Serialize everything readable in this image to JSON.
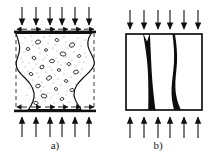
{
  "figure": {
    "background_color": "#ffffff",
    "ink_color": "#111111",
    "width": 211,
    "height": 155
  },
  "panels": [
    {
      "id": "a",
      "caption": "a)",
      "caption_x": 55,
      "caption_y": 146,
      "description": "Concrete cube under compression with platen friction, deforming into an hourglass shape",
      "specimen": {
        "left": 16,
        "right": 94,
        "top": 33,
        "bottom": 109,
        "waist_inset": 14,
        "fill_color": "#ffffff",
        "outline_color": "#111111"
      },
      "original_outline": {
        "style": "dashed",
        "color": "#3a3a3a",
        "left_x": 16,
        "right_x": 94
      },
      "platens": [
        {
          "name": "top-platen",
          "x": 14,
          "y": 31,
          "width": 82,
          "height": 2.6
        },
        {
          "name": "bottom-platen",
          "x": 14,
          "y": 110,
          "width": 82,
          "height": 2.6
        }
      ],
      "load_arrows_top": {
        "count": 6,
        "direction": "down",
        "y_start": 7,
        "y_end": 29,
        "x_positions": [
          22,
          36,
          50,
          62,
          75,
          89
        ]
      },
      "load_arrows_bottom": {
        "count": 6,
        "direction": "up",
        "y_start": 137,
        "y_end": 115,
        "x_positions": [
          22,
          36,
          50,
          62,
          75,
          89
        ]
      },
      "friction_arrows": {
        "description": "Horizontal platen friction restraint arrows",
        "top_y": 28.5,
        "bottom_y": 107,
        "segments": 6
      },
      "aggregate": {
        "particle_count": 22,
        "stipple_count": 150,
        "particle_color": "#1a1a1a",
        "stipple_color": "#2a2a2a"
      }
    },
    {
      "id": "b",
      "caption": "b)",
      "caption_x": 158,
      "caption_y": 146,
      "description": "Concrete cube under compression splitting with two vertical wedge cracks",
      "specimen": {
        "left": 126,
        "right": 202,
        "top": 34,
        "bottom": 110,
        "fill_color": "#ffffff",
        "outline_color": "#111111",
        "outline_width": 1.6
      },
      "cracks": [
        {
          "name": "left-splitting-crack",
          "top_x": 146,
          "bottom_x": 152,
          "top_width": 3.2,
          "bottom_width": 10,
          "notch": true
        },
        {
          "name": "right-splitting-crack",
          "top_x": 174,
          "bottom_x": 180,
          "top_width": 2.4,
          "bottom_width": 9,
          "notch": false
        }
      ],
      "load_arrows_top": {
        "count": 6,
        "direction": "down",
        "y_start": 10,
        "y_end": 31,
        "x_positions": [
          130,
          144,
          158,
          170,
          184,
          198
        ]
      },
      "load_arrows_bottom": {
        "count": 6,
        "direction": "up",
        "y_start": 138,
        "y_end": 116,
        "x_positions": [
          130,
          144,
          158,
          170,
          184,
          198
        ]
      }
    }
  ]
}
